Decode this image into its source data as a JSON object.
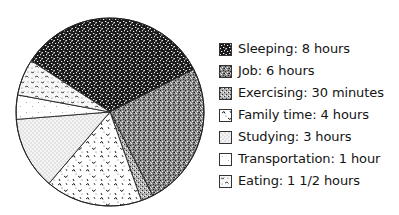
{
  "chart_data": {
    "type": "pie",
    "title": "",
    "unit": "hours",
    "total_hours": 24,
    "start_angle_deg": -57,
    "direction": "clockwise",
    "center": [
      110,
      112
    ],
    "radius": 94,
    "legend_position": "right",
    "slices": [
      {
        "key": "sleeping",
        "name": "Sleeping",
        "value": 8,
        "label": "Sleeping: 8 hours",
        "pattern": "dense-dark"
      },
      {
        "key": "job",
        "name": "Job",
        "value": 6,
        "label": "Job: 6 hours",
        "pattern": "medium-stipple"
      },
      {
        "key": "exercising",
        "name": "Exercising",
        "value": 0.5,
        "label": "Exercising: 30 minutes",
        "pattern": "fine-stipple"
      },
      {
        "key": "family",
        "name": "Family time",
        "value": 4,
        "label": "Family time: 4 hours",
        "pattern": "squiggle"
      },
      {
        "key": "studying",
        "name": "Studying",
        "value": 3,
        "label": "Studying: 3 hours",
        "pattern": "light-dots"
      },
      {
        "key": "transportation",
        "name": "Transportation",
        "value": 1,
        "label": "Transportation: 1 hour",
        "pattern": "sparse-dashes"
      },
      {
        "key": "eating",
        "name": "Eating",
        "value": 1.5,
        "label": "Eating: 1 1/2 hours",
        "pattern": "mixed-squiggle"
      }
    ]
  },
  "legend": {
    "items": [
      {
        "label": "Sleeping: 8 hours"
      },
      {
        "label": "Job: 6 hours"
      },
      {
        "label": "Exercising: 30 minutes"
      },
      {
        "label": "Family time: 4 hours"
      },
      {
        "label": "Studying: 3 hours"
      },
      {
        "label": "Transportation: 1 hour"
      },
      {
        "label": "Eating: 1 1/2 hours"
      }
    ]
  },
  "colors": {
    "ink": "#111111",
    "background": "#ffffff"
  }
}
